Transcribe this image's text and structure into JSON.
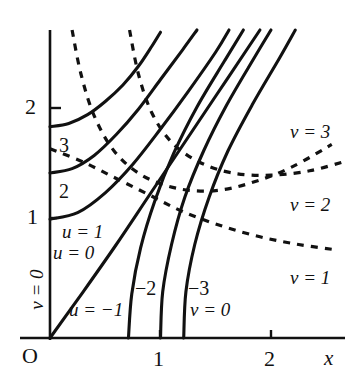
{
  "figure": {
    "background_color": "#ffffff",
    "curve_color": "#111111",
    "axis_color": "#111111"
  },
  "axes": {
    "x_axis_label": "x",
    "y_axis_label": "",
    "origin_label": "O",
    "x_ticks": [
      {
        "label": "1",
        "value": 1
      },
      {
        "label": "2",
        "value": 2
      }
    ],
    "y_ticks": [
      {
        "label": "1",
        "value": 1
      },
      {
        "label": "2",
        "value": 2
      }
    ]
  },
  "curve_labels": {
    "u_family": [
      {
        "label": "u = 1",
        "value": 1
      },
      {
        "label": "u = 0",
        "value": 0
      },
      {
        "label": "u = −1",
        "value": -1
      },
      {
        "label": "2",
        "value": 2
      },
      {
        "label": "3",
        "value": 3
      },
      {
        "label": "−2",
        "value": -2
      },
      {
        "label": "−3",
        "value": -3
      }
    ],
    "v_family": [
      {
        "label": "v = 0",
        "value": 0
      },
      {
        "label": "v = 0",
        "value": 0
      },
      {
        "label": "v = 1",
        "value": 1
      },
      {
        "label": "v = 2",
        "value": 2
      },
      {
        "label": "v = 3",
        "value": 3
      }
    ]
  },
  "chart_data": {
    "type": "line",
    "title": "",
    "xlabel": "x",
    "ylabel": "",
    "xlim": [
      0,
      2.7
    ],
    "ylim": [
      0,
      2.8
    ],
    "grid": false,
    "legend_position": "inline-annotations",
    "x_ticks": [
      1,
      2
    ],
    "y_ticks": [
      1,
      2
    ],
    "series": [
      {
        "name": "u = 3",
        "style": "solid",
        "label": "3",
        "points": [
          [
            0.0,
            1.92
          ],
          [
            0.17,
            1.95
          ],
          [
            0.34,
            2.03
          ],
          [
            0.5,
            2.15
          ],
          [
            0.66,
            2.3
          ],
          [
            0.8,
            2.47
          ],
          [
            0.92,
            2.65
          ],
          [
            1.0,
            2.78
          ]
        ]
      },
      {
        "name": "u = 2",
        "style": "solid",
        "label": "2",
        "points": [
          [
            0.0,
            1.5
          ],
          [
            0.2,
            1.54
          ],
          [
            0.4,
            1.66
          ],
          [
            0.6,
            1.85
          ],
          [
            0.8,
            2.08
          ],
          [
            1.0,
            2.35
          ],
          [
            1.2,
            2.62
          ],
          [
            1.33,
            2.8
          ]
        ]
      },
      {
        "name": "u = 1",
        "style": "solid",
        "label": "u = 1",
        "points": [
          [
            0.0,
            1.08
          ],
          [
            0.25,
            1.14
          ],
          [
            0.5,
            1.32
          ],
          [
            0.75,
            1.58
          ],
          [
            1.0,
            1.9
          ],
          [
            1.25,
            2.24
          ],
          [
            1.5,
            2.6
          ],
          [
            1.62,
            2.8
          ]
        ]
      },
      {
        "name": "u = 0",
        "style": "solid",
        "label": "u = 0",
        "points": [
          [
            0.0,
            0.0
          ],
          [
            0.3,
            0.42
          ],
          [
            0.6,
            0.85
          ],
          [
            0.9,
            1.3
          ],
          [
            1.2,
            1.75
          ],
          [
            1.5,
            2.2
          ],
          [
            1.8,
            2.65
          ],
          [
            1.9,
            2.8
          ]
        ]
      },
      {
        "name": "u = −1",
        "style": "solid",
        "label": "u = −1",
        "points": [
          [
            0.71,
            0.0
          ],
          [
            0.74,
            0.4
          ],
          [
            0.82,
            0.82
          ],
          [
            0.95,
            1.25
          ],
          [
            1.12,
            1.68
          ],
          [
            1.33,
            2.1
          ],
          [
            1.58,
            2.52
          ],
          [
            1.75,
            2.8
          ]
        ]
      },
      {
        "name": "u = −2",
        "style": "solid",
        "label": "−2",
        "points": [
          [
            1.0,
            0.0
          ],
          [
            1.02,
            0.42
          ],
          [
            1.1,
            0.85
          ],
          [
            1.22,
            1.28
          ],
          [
            1.39,
            1.7
          ],
          [
            1.6,
            2.12
          ],
          [
            1.85,
            2.55
          ],
          [
            2.0,
            2.8
          ]
        ]
      },
      {
        "name": "u = −3",
        "style": "solid",
        "label": "−3",
        "points": [
          [
            1.21,
            0.0
          ],
          [
            1.23,
            0.42
          ],
          [
            1.31,
            0.85
          ],
          [
            1.44,
            1.28
          ],
          [
            1.61,
            1.7
          ],
          [
            1.83,
            2.12
          ],
          [
            2.08,
            2.55
          ],
          [
            2.22,
            2.8
          ]
        ]
      },
      {
        "name": "v = 3 (dashed)",
        "style": "dashed",
        "label": "v = 3",
        "points": [
          [
            0.2,
            2.8
          ],
          [
            0.28,
            2.4
          ],
          [
            0.4,
            2.02
          ],
          [
            0.58,
            1.7
          ],
          [
            0.83,
            1.48
          ],
          [
            1.15,
            1.36
          ],
          [
            1.5,
            1.34
          ],
          [
            1.85,
            1.42
          ],
          [
            2.2,
            1.56
          ],
          [
            2.55,
            1.76
          ]
        ]
      },
      {
        "name": "v = 2 (dashed)",
        "style": "dashed",
        "label": "v = 2",
        "points": [
          [
            0.72,
            2.8
          ],
          [
            0.8,
            2.4
          ],
          [
            0.92,
            2.05
          ],
          [
            1.1,
            1.78
          ],
          [
            1.35,
            1.6
          ],
          [
            1.65,
            1.5
          ],
          [
            2.0,
            1.48
          ],
          [
            2.35,
            1.52
          ],
          [
            2.65,
            1.6
          ]
        ]
      },
      {
        "name": "v = 1 (dashed)",
        "style": "dashed",
        "label": "v = 1",
        "points": [
          [
            0.0,
            1.72
          ],
          [
            0.3,
            1.6
          ],
          [
            0.6,
            1.45
          ],
          [
            0.9,
            1.3
          ],
          [
            1.2,
            1.15
          ],
          [
            1.55,
            1.02
          ],
          [
            1.9,
            0.92
          ],
          [
            2.25,
            0.85
          ],
          [
            2.6,
            0.8
          ]
        ]
      }
    ]
  }
}
